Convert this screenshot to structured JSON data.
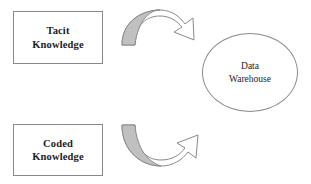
{
  "diagram": {
    "canvas": {
      "width": 311,
      "height": 184,
      "background": "#ffffff"
    },
    "colors": {
      "stroke": "#8a8a8a",
      "arrow_fill_gray": "#c0c0c0",
      "arrow_fill_white": "#ffffff",
      "text": "#1c1c1c"
    },
    "nodes": {
      "tacit": {
        "line1": "Tacit",
        "line2": "Knowledge",
        "shape": "rectangle"
      },
      "coded": {
        "line1": "Coded",
        "line2": "Knowledge",
        "shape": "rectangle"
      },
      "warehouse": {
        "line1": "Data",
        "line2": "Warehouse",
        "shape": "ellipse"
      }
    },
    "arrows": [
      {
        "id": "tacit-to-warehouse",
        "icon": "curved-arrow-down-right-icon",
        "from": "tacit",
        "to": "warehouse",
        "direction": "clockwise-over"
      },
      {
        "id": "coded-to-warehouse",
        "icon": "curved-arrow-up-right-icon",
        "from": "coded",
        "to": "warehouse",
        "direction": "counterclockwise-under"
      }
    ]
  }
}
